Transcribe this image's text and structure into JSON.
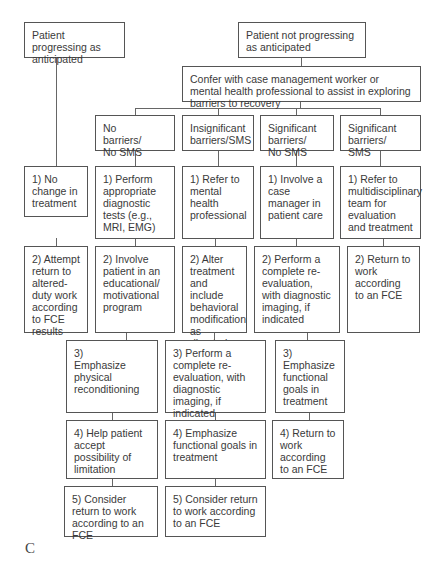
{
  "diagram": {
    "top": {
      "progressing": "Patient progressing as anticipated",
      "not_progressing": "Patient not progressing as anticipated",
      "confer": "Confer with case management worker or mental health professional to assist in exploring barriers to recovery"
    },
    "categories": [
      "No barriers/ No SMS",
      "Insignificant barriers/SMS",
      "Significant barriers/ No SMS",
      "Significant barriers/ SMS"
    ],
    "progressing_steps": [
      "1) No change in treatment",
      "2) Attempt return to altered-duty work according to FCE results"
    ],
    "no_barriers_steps": [
      "1) Perform appropriate diagnostic tests (e.g., MRI, EMG)",
      "2) Involve patient in an educational/ motivational program",
      "3) Emphasize physical reconditioning",
      "4) Help patient accept possibility of limitation",
      "5) Consider return to work according to an FCE"
    ],
    "insignificant_steps": [
      "1) Refer to mental health professional",
      "2) Alter treatment and include behavioral modification as directed",
      "3) Perform a complete re-evaluation, with diagnostic imaging, if indicated",
      "4) Emphasize functional goals in treatment",
      "5) Consider return to work according to an FCE"
    ],
    "significant_no_sms_steps": [
      "1) Involve a case manager in patient care",
      "2) Perform a complete re-evaluation, with diagnostic imaging, if indicated",
      "3) Emphasize functional goals in treatment",
      "4) Return to work according to an FCE"
    ],
    "significant_sms_steps": [
      "1) Refer to multidisciplinary team for evaluation and treatment",
      "2) Return to work according to an FCE"
    ],
    "panel_label": "C"
  }
}
